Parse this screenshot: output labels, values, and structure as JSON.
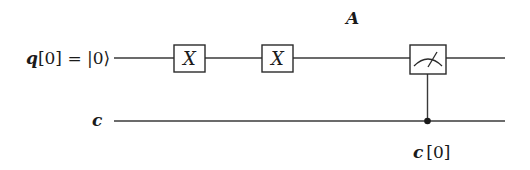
{
  "diagram": {
    "type": "quantum-circuit",
    "annotation": "A",
    "wires": [
      {
        "id": "q0",
        "label": "q[0] = |0⟩",
        "label_parts": {
          "name": "q",
          "index": "[0]",
          "eq": " = ",
          "ket": "|0⟩"
        },
        "kind": "quantum"
      },
      {
        "id": "c",
        "label": "c",
        "kind": "classical"
      }
    ],
    "gates": [
      {
        "id": "x1",
        "symbol": "X",
        "wire": "q0"
      },
      {
        "id": "x2",
        "symbol": "X",
        "wire": "q0"
      },
      {
        "id": "m1",
        "symbol": "measure",
        "wire": "q0",
        "target": "c",
        "target_label": "c[0]",
        "target_label_parts": {
          "name": "c",
          "index": "[0]"
        }
      }
    ]
  }
}
